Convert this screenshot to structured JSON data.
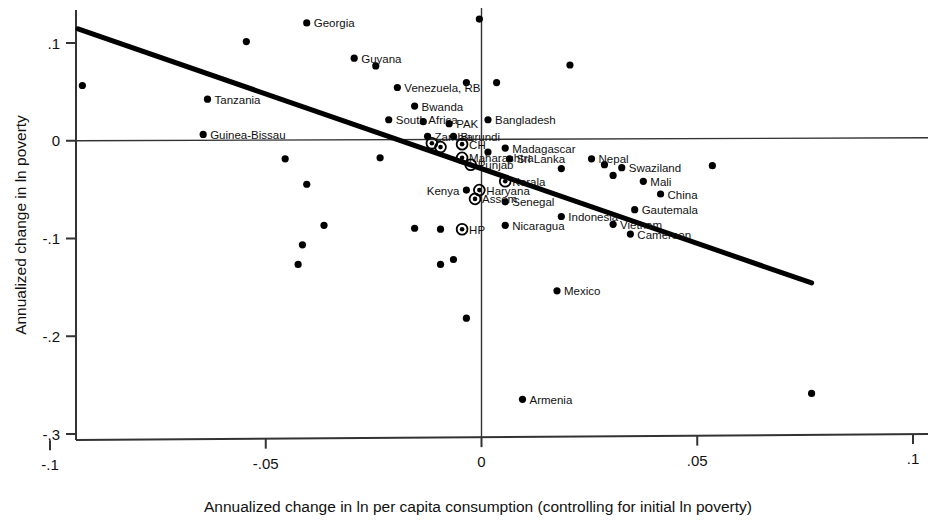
{
  "chart_data": {
    "type": "scatter",
    "title": "",
    "xlabel": "Annualized change in ln per capita consumption (controlling for initial ln poverty)",
    "ylabel": "Annualized change in ln poverty",
    "xlim": [
      -0.1,
      0.1
    ],
    "ylim": [
      -0.3,
      0.13
    ],
    "xticks": [
      -0.1,
      -0.05,
      0,
      0.05,
      0.1
    ],
    "xticklabels": [
      "-.1",
      "-.05",
      "0",
      ".05",
      ".1"
    ],
    "yticks": [
      0.1,
      0,
      -0.1,
      -0.2,
      -0.3
    ],
    "yticklabels": [
      ".1",
      "0",
      "-.1",
      "-.2",
      "-.3"
    ],
    "grid": false,
    "legend": null,
    "reference_lines": [
      {
        "name": "horizontal-zero-line",
        "orientation": "horizontal",
        "value": 0
      },
      {
        "name": "vertical-zero-line",
        "orientation": "vertical",
        "value": 0
      }
    ],
    "fit_line": {
      "name": "regression-line",
      "x_start": -0.0935,
      "y_start": 0.1145,
      "x_end": 0.0765,
      "y_end": -0.1455
    },
    "marker_styles": {
      "plain": "filled-circle",
      "circled": "filled-circle-with-ring (Indian states)"
    },
    "points": [
      {
        "label": "Georgia",
        "x": -0.0405,
        "y": 0.1205,
        "marker": "plain",
        "label_pos": "right"
      },
      {
        "label": "",
        "x": -0.0005,
        "y": 0.1245,
        "marker": "plain",
        "label_pos": "right"
      },
      {
        "label": "",
        "x": -0.0545,
        "y": 0.1015,
        "marker": "plain",
        "label_pos": "right"
      },
      {
        "label": "Guyana",
        "x": -0.0295,
        "y": 0.0845,
        "marker": "plain",
        "label_pos": "right"
      },
      {
        "label": "",
        "x": -0.0245,
        "y": 0.0765,
        "marker": "plain",
        "label_pos": "right"
      },
      {
        "label": "",
        "x": 0.0205,
        "y": 0.0775,
        "marker": "plain",
        "label_pos": "right"
      },
      {
        "label": "",
        "x": -0.0925,
        "y": 0.0565,
        "marker": "plain",
        "label_pos": "right"
      },
      {
        "label": "Venezuela, RB",
        "x": -0.0195,
        "y": 0.0545,
        "marker": "plain",
        "label_pos": "right"
      },
      {
        "label": "",
        "x": -0.0035,
        "y": 0.0595,
        "marker": "plain",
        "label_pos": "right"
      },
      {
        "label": "",
        "x": 0.0035,
        "y": 0.0595,
        "marker": "plain",
        "label_pos": "right"
      },
      {
        "label": "Tanzania",
        "x": -0.0635,
        "y": 0.0425,
        "marker": "plain",
        "label_pos": "right"
      },
      {
        "label": "Bwanda",
        "x": -0.0155,
        "y": 0.0355,
        "marker": "plain",
        "label_pos": "right"
      },
      {
        "label": "South Africa",
        "x": -0.0215,
        "y": 0.0215,
        "marker": "plain",
        "label_pos": "right"
      },
      {
        "label": "",
        "x": -0.0135,
        "y": 0.0195,
        "marker": "plain",
        "label_pos": "right"
      },
      {
        "label": "Guinea-Bissau",
        "x": -0.0645,
        "y": 0.0065,
        "marker": "plain",
        "label_pos": "right"
      },
      {
        "label": "PAK",
        "x": -0.0075,
        "y": 0.0175,
        "marker": "plain",
        "label_pos": "right"
      },
      {
        "label": "Bangladesh",
        "x": 0.0015,
        "y": 0.0215,
        "marker": "plain",
        "label_pos": "right"
      },
      {
        "label": "Zambia",
        "x": -0.0125,
        "y": 0.0045,
        "marker": "plain",
        "label_pos": "right"
      },
      {
        "label": "Burundi",
        "x": -0.0065,
        "y": 0.0045,
        "marker": "plain",
        "label_pos": "right"
      },
      {
        "label": "",
        "x": -0.0115,
        "y": -0.0025,
        "marker": "circled",
        "label_pos": "right"
      },
      {
        "label": "CH",
        "x": -0.0045,
        "y": -0.0035,
        "marker": "circled",
        "label_pos": "right"
      },
      {
        "label": "",
        "x": -0.0095,
        "y": -0.0065,
        "marker": "circled",
        "label_pos": "right"
      },
      {
        "label": "Madagascar",
        "x": 0.0055,
        "y": -0.0075,
        "marker": "plain",
        "label_pos": "right"
      },
      {
        "label": "",
        "x": 0.0015,
        "y": -0.0115,
        "marker": "plain",
        "label_pos": "right"
      },
      {
        "label": "Maharashtra",
        "x": -0.0045,
        "y": -0.0175,
        "marker": "circled",
        "label_pos": "right"
      },
      {
        "label": "Sri Lanka",
        "x": 0.0065,
        "y": -0.0185,
        "marker": "plain",
        "label_pos": "right"
      },
      {
        "label": "Nepal",
        "x": 0.0255,
        "y": -0.0185,
        "marker": "plain",
        "label_pos": "right"
      },
      {
        "label": "",
        "x": -0.0235,
        "y": -0.0175,
        "marker": "plain",
        "label_pos": "right"
      },
      {
        "label": "Punjab",
        "x": -0.0025,
        "y": -0.0245,
        "marker": "circled",
        "label_pos": "right"
      },
      {
        "label": "Swaziland",
        "x": 0.0325,
        "y": -0.0275,
        "marker": "plain",
        "label_pos": "right"
      },
      {
        "label": "",
        "x": 0.0285,
        "y": -0.0245,
        "marker": "plain",
        "label_pos": "right"
      },
      {
        "label": "",
        "x": 0.0185,
        "y": -0.0285,
        "marker": "plain",
        "label_pos": "right"
      },
      {
        "label": "",
        "x": 0.0535,
        "y": -0.0255,
        "marker": "plain",
        "label_pos": "right"
      },
      {
        "label": "Kerala",
        "x": 0.0055,
        "y": -0.0415,
        "marker": "circled",
        "label_pos": "right"
      },
      {
        "label": "Mali",
        "x": 0.0375,
        "y": -0.0415,
        "marker": "plain",
        "label_pos": "right"
      },
      {
        "label": "",
        "x": 0.0305,
        "y": -0.0355,
        "marker": "plain",
        "label_pos": "right"
      },
      {
        "label": "Haryana",
        "x": -0.0005,
        "y": -0.0505,
        "marker": "circled",
        "label_pos": "right"
      },
      {
        "label": "China",
        "x": 0.0415,
        "y": -0.0545,
        "marker": "plain",
        "label_pos": "right"
      },
      {
        "label": "Assem",
        "x": -0.0015,
        "y": -0.0595,
        "marker": "circled",
        "label_pos": "right"
      },
      {
        "label": "Senegal",
        "x": 0.0055,
        "y": -0.0625,
        "marker": "plain",
        "label_pos": "right"
      },
      {
        "label": "Kenya",
        "x": -0.0035,
        "y": -0.0505,
        "marker": "plain",
        "label_pos": "left"
      },
      {
        "label": "Gautemala",
        "x": 0.0355,
        "y": -0.0705,
        "marker": "plain",
        "label_pos": "right"
      },
      {
        "label": "Indonesia",
        "x": 0.0185,
        "y": -0.0775,
        "marker": "plain",
        "label_pos": "right"
      },
      {
        "label": "HP",
        "x": -0.0045,
        "y": -0.0905,
        "marker": "circled",
        "label_pos": "right"
      },
      {
        "label": "",
        "x": -0.0095,
        "y": -0.0905,
        "marker": "plain",
        "label_pos": "right"
      },
      {
        "label": "Nicaragua",
        "x": 0.0055,
        "y": -0.0865,
        "marker": "plain",
        "label_pos": "right"
      },
      {
        "label": "Vietnam",
        "x": 0.0305,
        "y": -0.0855,
        "marker": "plain",
        "label_pos": "right"
      },
      {
        "label": "Cameroon",
        "x": 0.0345,
        "y": -0.0955,
        "marker": "plain",
        "label_pos": "right"
      },
      {
        "label": "",
        "x": -0.0455,
        "y": -0.0185,
        "marker": "plain",
        "label_pos": "right"
      },
      {
        "label": "",
        "x": -0.0405,
        "y": -0.0445,
        "marker": "plain",
        "label_pos": "right"
      },
      {
        "label": "",
        "x": -0.0365,
        "y": -0.0865,
        "marker": "plain",
        "label_pos": "right"
      },
      {
        "label": "",
        "x": -0.0415,
        "y": -0.1065,
        "marker": "plain",
        "label_pos": "right"
      },
      {
        "label": "",
        "x": -0.0155,
        "y": -0.0895,
        "marker": "plain",
        "label_pos": "right"
      },
      {
        "label": "",
        "x": -0.0425,
        "y": -0.1265,
        "marker": "plain",
        "label_pos": "right"
      },
      {
        "label": "",
        "x": -0.0065,
        "y": -0.1215,
        "marker": "plain",
        "label_pos": "right"
      },
      {
        "label": "",
        "x": -0.0095,
        "y": -0.1265,
        "marker": "plain",
        "label_pos": "right"
      },
      {
        "label": "Mexico",
        "x": 0.0175,
        "y": -0.1535,
        "marker": "plain",
        "label_pos": "right"
      },
      {
        "label": "",
        "x": -0.0035,
        "y": -0.1815,
        "marker": "plain",
        "label_pos": "right"
      },
      {
        "label": "Armenia",
        "x": 0.0095,
        "y": -0.2645,
        "marker": "plain",
        "label_pos": "right"
      },
      {
        "label": "",
        "x": 0.0765,
        "y": -0.2585,
        "marker": "plain",
        "label_pos": "right"
      }
    ]
  }
}
